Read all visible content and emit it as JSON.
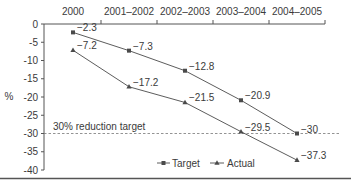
{
  "chart_data": {
    "type": "line",
    "title": "",
    "xlabel": "",
    "ylabel": "%",
    "ylim": [
      -40,
      0
    ],
    "yticks": [
      0,
      -5,
      -10,
      -15,
      -20,
      -25,
      -30,
      -35,
      -40
    ],
    "x_axis_position": "top",
    "categories": [
      "2000",
      "2001–2002",
      "2002–2003",
      "2003–2004",
      "2004–2005"
    ],
    "series": [
      {
        "name": "Target",
        "marker": "square",
        "values": [
          -2.3,
          -7.3,
          -12.8,
          -20.9,
          -30
        ]
      },
      {
        "name": "Actual",
        "marker": "triangle",
        "values": [
          -7.2,
          -17.2,
          -21.5,
          -29.5,
          -37.3
        ]
      }
    ],
    "reference_line": {
      "value": -30,
      "label": "30% reduction target",
      "style": "dashed"
    },
    "data_labels": {
      "Target": [
        "−2.3",
        "−7.3",
        "−12.8",
        "−20.9",
        "−30"
      ],
      "Actual": [
        "−7.2",
        "−17.2",
        "−21.5",
        "−29.5",
        "−37.3"
      ]
    },
    "ytick_labels": [
      "0",
      "-5",
      "-10",
      "-15",
      "-20",
      "-25",
      "-30",
      "-35",
      "-40"
    ],
    "legend": {
      "position": "bottom-right",
      "entries": [
        "Target",
        "Actual"
      ]
    },
    "grid": false
  },
  "colors": {
    "line": "#4a4a4a",
    "axis": "#555555",
    "dashed": "#777777",
    "text": "#3a3a3a"
  }
}
